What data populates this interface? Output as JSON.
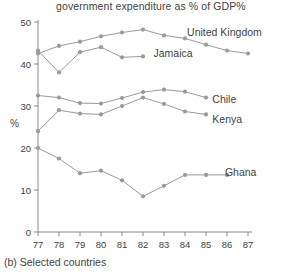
{
  "figure": {
    "title": "government expenditure as % of GDP%",
    "caption": "(b) Selected countries",
    "y_axis_name": "%"
  },
  "chart_data": {
    "type": "line",
    "title": "government expenditure as % of GDP%",
    "xlabel": "",
    "ylabel": "%",
    "xlim": [
      77,
      87
    ],
    "ylim": [
      0,
      50
    ],
    "yticks": [
      0,
      10,
      20,
      30,
      40,
      50
    ],
    "x": [
      77,
      78,
      79,
      80,
      81,
      82,
      83,
      84,
      85,
      86,
      87
    ],
    "xticklabels": [
      "77",
      "78",
      "79",
      "80",
      "81",
      "82",
      "83",
      "84",
      "85",
      "86",
      "87"
    ],
    "grid": false,
    "legend_position": "inline-right-of-line",
    "series": [
      {
        "name": "United Kingdom",
        "values": [
          42.5,
          44.3,
          45.3,
          46.6,
          47.5,
          48.2,
          46.8,
          46.1,
          44.6,
          43.2,
          42.5
        ]
      },
      {
        "name": "Jamaica",
        "values": [
          43.2,
          38.0,
          42.8,
          44.0,
          41.6,
          41.8,
          null,
          null,
          null,
          null,
          null
        ]
      },
      {
        "name": "Chile",
        "values": [
          32.5,
          32.0,
          30.7,
          30.6,
          31.9,
          33.3,
          33.9,
          33.4,
          32.0,
          null,
          null
        ]
      },
      {
        "name": "Kenya",
        "values": [
          24.0,
          29.0,
          28.2,
          28.0,
          30.0,
          32.0,
          30.5,
          28.7,
          28.0,
          null,
          null
        ]
      },
      {
        "name": "Ghana",
        "values": [
          20.0,
          17.5,
          14.0,
          14.6,
          12.3,
          8.5,
          11.0,
          13.6,
          13.6,
          13.6,
          null
        ]
      }
    ],
    "annotations": [
      {
        "text": "United Kingdom",
        "x": 84.1,
        "y": 47.6
      },
      {
        "text": "Jamaica",
        "x": 82.5,
        "y": 42.4
      },
      {
        "text": "Chile",
        "x": 85.3,
        "y": 31.6
      },
      {
        "text": "Kenya",
        "x": 85.3,
        "y": 26.9
      },
      {
        "text": "Ghana",
        "x": 85.9,
        "y": 14.2
      }
    ],
    "colors": {
      "line": "#9a9a9a",
      "marker": "#9a9a9a",
      "axis": "#8a8a8a",
      "text": "#3f3f3f"
    }
  }
}
